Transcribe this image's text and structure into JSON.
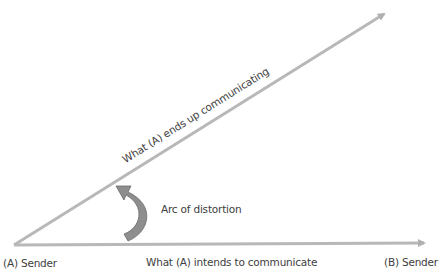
{
  "diagram": {
    "labels": {
      "sender_a": "(A) Sender",
      "sender_b": "(B) Sender",
      "intended": "What (A) intends to communicate",
      "actual": "What (A) ends up communicating",
      "arc": "Arc of distortion"
    },
    "colors": {
      "line": "#b3b3b3",
      "arc_fill": "#8c8c8c",
      "arc_stroke": "#6e6e6e",
      "text": "#404040"
    }
  }
}
